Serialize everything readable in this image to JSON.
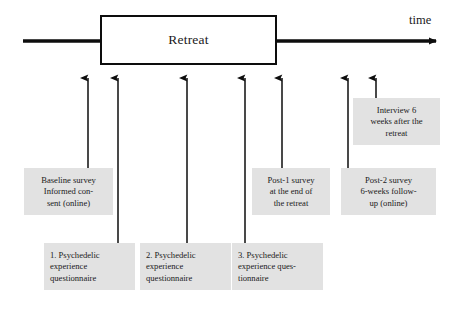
{
  "figure": {
    "type": "timeline-diagram",
    "title_on_axis": "time",
    "background_color": "#ffffff",
    "note_fill_color": "#e2e2e2",
    "line_color": "#0d0d0d"
  },
  "axis": {
    "label": "time",
    "start_x": 23,
    "end_x": 443,
    "y": 41,
    "arrowhead": "right"
  },
  "retreat": {
    "label": "Retreat",
    "x": 100,
    "y": 15,
    "width": 177,
    "height": 50
  },
  "markers": [
    {
      "id": "marker-1",
      "x": 88,
      "tip_y": 70,
      "tail_y": 168,
      "note": "note-baseline-survey"
    },
    {
      "id": "marker-2",
      "x": 118,
      "tip_y": 70,
      "tail_y": 243,
      "note": "note-pex-1"
    },
    {
      "id": "marker-3",
      "x": 187,
      "tip_y": 70,
      "tail_y": 243,
      "note": "note-pex-2"
    },
    {
      "id": "marker-4",
      "x": 245,
      "tip_y": 70,
      "tail_y": 243,
      "note": "note-pex-3"
    },
    {
      "id": "marker-5",
      "x": 282,
      "tip_y": 70,
      "tail_y": 168,
      "note": "note-post-1"
    },
    {
      "id": "marker-6",
      "x": 348,
      "tip_y": 70,
      "tail_y": 168,
      "note": "note-post-2"
    },
    {
      "id": "marker-7",
      "x": 376,
      "tip_y": 70,
      "tail_y": 98,
      "note": "note-interview"
    }
  ],
  "notes": [
    {
      "id": "note-baseline-survey",
      "lines": [
        "Baseline survey",
        "Informed con-",
        "sent (online)"
      ],
      "x": 24,
      "y": 168,
      "width": 89,
      "height": 47,
      "align": "center"
    },
    {
      "id": "note-pex-1",
      "lines": [
        "1. Psychedelic",
        "experience",
        "questionnaire"
      ],
      "x": 44,
      "y": 243,
      "width": 91,
      "height": 47,
      "align": "left"
    },
    {
      "id": "note-pex-2",
      "lines": [
        "2. Psychedelic",
        "experience",
        "questionnaire"
      ],
      "x": 140,
      "y": 243,
      "width": 91,
      "height": 47,
      "align": "left"
    },
    {
      "id": "note-pex-3",
      "lines": [
        "3. Psychedelic",
        "experience ques-",
        "tionnaire"
      ],
      "x": 232,
      "y": 243,
      "width": 91,
      "height": 47,
      "align": "left"
    },
    {
      "id": "note-post-1",
      "lines": [
        "Post-1 survey",
        "at the end of",
        "the retreat"
      ],
      "x": 252,
      "y": 168,
      "width": 78,
      "height": 47,
      "align": "center"
    },
    {
      "id": "note-post-2",
      "lines": [
        "Post-2 survey",
        "6-weeks follow-",
        "up (online)"
      ],
      "x": 341,
      "y": 168,
      "width": 95,
      "height": 47,
      "align": "center"
    },
    {
      "id": "note-interview",
      "lines": [
        "Interview 6",
        "weeks after the",
        "retreat"
      ],
      "x": 353,
      "y": 98,
      "width": 87,
      "height": 47,
      "align": "center"
    }
  ]
}
